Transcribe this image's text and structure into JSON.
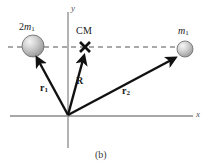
{
  "figure": {
    "caption": "(b)",
    "axes": {
      "x_label": "x",
      "y_label": "y",
      "origin": {
        "x": 68,
        "y": 116
      },
      "x_axis": {
        "x1": 10,
        "x2": 193,
        "y": 116
      },
      "y_axis": {
        "x": 68,
        "y1": 12,
        "y2": 148
      },
      "axis_color": "#8a8a8a"
    },
    "dashed_line": {
      "x1": 8,
      "x2": 186,
      "y": 47,
      "color": "#555555",
      "dash": "5,4"
    },
    "bodies": [
      {
        "name": "left-mass",
        "label": "2m",
        "label_prefix": "2",
        "label_symbol": "m",
        "label_subscript": "1",
        "cx": 33,
        "cy": 46,
        "r": 11,
        "fill": "#b9b9b9",
        "highlight": "#f0f0f0",
        "stroke": "#707070"
      },
      {
        "name": "right-mass",
        "label": "m",
        "label_prefix": "",
        "label_symbol": "m",
        "label_subscript": "1",
        "cx": 185,
        "cy": 49,
        "r": 8,
        "fill": "#bdbdbd",
        "highlight": "#f2f2f2",
        "stroke": "#737373"
      }
    ],
    "cm_marker": {
      "label": "CM",
      "x": 85,
      "y": 47,
      "size": 7,
      "color": "#111111"
    },
    "vectors": [
      {
        "name": "r1",
        "label": "r",
        "subscript": "1",
        "x1": 68,
        "y1": 115,
        "x2": 36,
        "y2": 57,
        "label_x": 44,
        "label_y": 88,
        "color": "#111111",
        "width": 2.4
      },
      {
        "name": "R",
        "label": "R",
        "subscript": "",
        "x1": 68,
        "y1": 115,
        "x2": 84,
        "y2": 55,
        "label_x": 79,
        "label_y": 82,
        "color": "#111111",
        "width": 2.4
      },
      {
        "name": "r2",
        "label": "r",
        "subscript": "2",
        "x1": 68,
        "y1": 115,
        "x2": 176,
        "y2": 57,
        "label_x": 126,
        "label_y": 92,
        "color": "#111111",
        "width": 2.4
      }
    ]
  }
}
